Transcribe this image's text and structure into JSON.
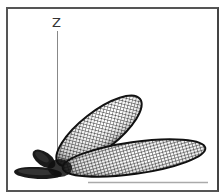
{
  "diagram": {
    "type": "3d-radiation-pattern",
    "axis_labels": {
      "z": "Z"
    },
    "colors": {
      "frame": "#555555",
      "axis": "#888888",
      "mesh": "#111111",
      "lobe_fill": "#ffffff",
      "ground_line": "#aaaaaa"
    },
    "lobes": [
      {
        "name": "main-upper-lobe",
        "description": "elongated wireframe lobe tilted upward to the right"
      },
      {
        "name": "main-right-lobe",
        "description": "large near-horizontal wireframe lobe pointing right"
      },
      {
        "name": "back-upper-lobe",
        "description": "small dark lobe pointing up-left"
      },
      {
        "name": "back-left-lobe",
        "description": "dark lobe pointing left near ground"
      }
    ]
  }
}
